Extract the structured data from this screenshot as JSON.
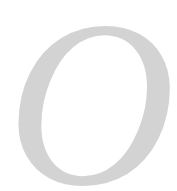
{
  "drop_cap": {
    "letter": "O",
    "color": "#d3d3d3",
    "background": "#ffffff"
  }
}
